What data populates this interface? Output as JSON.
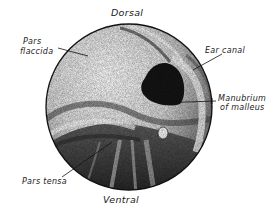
{
  "figure": {
    "orientation": {
      "top": "Dorsal",
      "bottom": "Ventral"
    },
    "labels": [
      {
        "id": "pars-flaccida",
        "line1": "Pars",
        "line2": "flaccida"
      },
      {
        "id": "ear-canal",
        "line1": "Ear canal"
      },
      {
        "id": "manubrium",
        "line1": "Manubrium",
        "line2": "of malleus"
      },
      {
        "id": "pars-tensa",
        "line1": "Pars tensa"
      }
    ],
    "colors": {
      "ink": "#111111",
      "background": "#ffffff",
      "shade_light": "#d8d8d8",
      "shade_mid": "#8a8a8a",
      "shade_dark": "#2a2a2a"
    }
  }
}
